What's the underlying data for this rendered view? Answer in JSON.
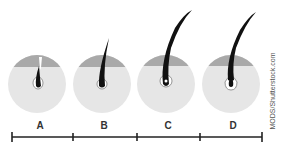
{
  "diagram": {
    "stages": [
      {
        "label": "A",
        "description": "hair shaft emerging, short"
      },
      {
        "label": "B",
        "description": "hair growing, medium length"
      },
      {
        "label": "C",
        "description": "hair fully grown, long"
      },
      {
        "label": "D",
        "description": "bulb detaching, club hair"
      }
    ],
    "credit": "MODS/Shutterstock.com",
    "colors": {
      "follicle_fill": "#e6e6e6",
      "skin_band": "#a9a9a9",
      "hair": "#111111",
      "timeline": "#222222"
    }
  }
}
